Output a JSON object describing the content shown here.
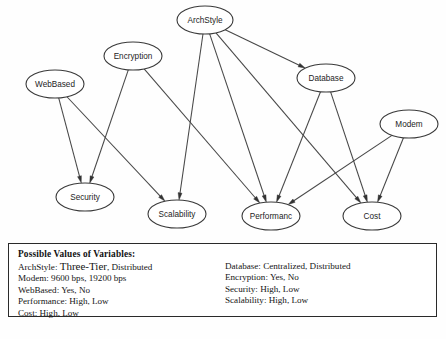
{
  "diagram": {
    "type": "directed-acyclic-graph",
    "colors": {
      "node_fill": "#ffffff",
      "node_stroke": "#3a3a3a",
      "edge": "#474747",
      "arrowhead": "#333333",
      "background": "#fefefe",
      "legend_border": "#2a2a2a",
      "text": "#141414"
    },
    "nodes": [
      {
        "id": "archstyle",
        "label": "ArchStyle",
        "cx": 205,
        "cy": 20,
        "rx": 28,
        "ry": 14
      },
      {
        "id": "encryption",
        "label": "Encryption",
        "cx": 133,
        "cy": 56,
        "rx": 29,
        "ry": 14
      },
      {
        "id": "database",
        "label": "Database",
        "cx": 326,
        "cy": 78,
        "rx": 29,
        "ry": 14
      },
      {
        "id": "webbased",
        "label": "WebBased",
        "cx": 55,
        "cy": 84,
        "rx": 29,
        "ry": 14
      },
      {
        "id": "modem",
        "label": "Modem",
        "cx": 409,
        "cy": 124,
        "rx": 29,
        "ry": 14
      },
      {
        "id": "security",
        "label": "Security",
        "cx": 85,
        "cy": 197,
        "rx": 29,
        "ry": 14
      },
      {
        "id": "scalability",
        "label": "Scalability",
        "cx": 177,
        "cy": 214,
        "rx": 29,
        "ry": 14
      },
      {
        "id": "performance",
        "label": "Performanc",
        "cx": 271,
        "cy": 216,
        "rx": 29,
        "ry": 14
      },
      {
        "id": "cost",
        "label": "Cost",
        "cx": 372,
        "cy": 216,
        "rx": 29,
        "ry": 14
      }
    ],
    "edges": [
      {
        "from": "archstyle",
        "to": "database"
      },
      {
        "from": "archstyle",
        "to": "scalability"
      },
      {
        "from": "archstyle",
        "to": "performance"
      },
      {
        "from": "archstyle",
        "to": "cost"
      },
      {
        "from": "encryption",
        "to": "security"
      },
      {
        "from": "encryption",
        "to": "performance"
      },
      {
        "from": "webbased",
        "to": "security"
      },
      {
        "from": "webbased",
        "to": "scalability"
      },
      {
        "from": "database",
        "to": "performance"
      },
      {
        "from": "database",
        "to": "cost"
      },
      {
        "from": "modem",
        "to": "performance"
      },
      {
        "from": "modem",
        "to": "cost"
      }
    ]
  },
  "legend": {
    "title": "Possible Values of Variables:",
    "left_column": [
      {
        "variable": "ArchStyle",
        "values": "Three-Tier, Distributed",
        "emphasis": "Three-Tier"
      },
      {
        "variable": "Modem",
        "values": "9600 bps, 19200 bps"
      },
      {
        "variable": "WebBased",
        "values": "Yes, No"
      },
      {
        "variable": "Performance",
        "values": "High, Low"
      },
      {
        "variable": "Cost",
        "values": "High, Low"
      }
    ],
    "right_column": [
      {
        "variable": "Database",
        "values": "Centralized, Distributed"
      },
      {
        "variable": "Encryption",
        "values": "Yes, No"
      },
      {
        "variable": "Security",
        "values": "High, Low"
      },
      {
        "variable": "Scalability",
        "values": "High, Low"
      }
    ]
  }
}
